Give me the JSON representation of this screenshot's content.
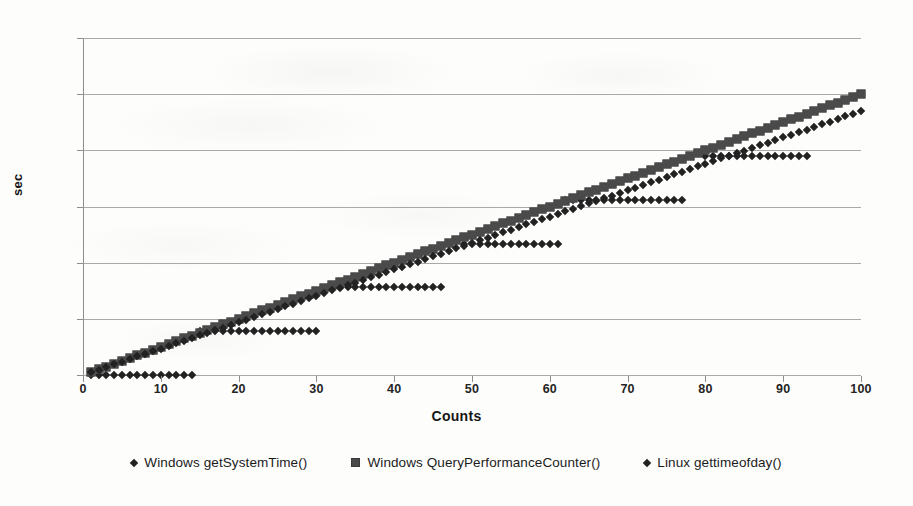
{
  "chart_data": {
    "type": "scatter",
    "title": "",
    "xlabel": "Counts",
    "ylabel": "sec",
    "xlim": [
      0,
      100
    ],
    "ylim": [
      0,
      0.12
    ],
    "xticks": [
      0,
      10,
      20,
      30,
      40,
      50,
      60,
      70,
      80,
      90,
      100
    ],
    "yticks": [
      0,
      0.02,
      0.04,
      0.06,
      0.08,
      0.1,
      0.12
    ],
    "ytick_labels": [
      "0",
      "0.02",
      "0.04",
      "0.06",
      "0.08",
      "0.1",
      "0.12"
    ],
    "xtick_labels": [
      "0",
      "10",
      "20",
      "30",
      "40",
      "50",
      "60",
      "70",
      "80",
      "90",
      "100"
    ],
    "grid": "horizontal",
    "legend_position": "bottom",
    "series": [
      {
        "name": "Windows getSystemTime()",
        "marker": "diamond",
        "color": "#222222",
        "x": [
          1,
          2,
          3,
          4,
          5,
          6,
          7,
          8,
          9,
          10,
          11,
          12,
          13,
          14,
          15,
          16,
          17,
          18,
          19,
          20,
          21,
          22,
          23,
          24,
          25,
          26,
          27,
          28,
          29,
          30,
          33,
          34,
          35,
          36,
          37,
          38,
          39,
          40,
          41,
          42,
          43,
          44,
          45,
          46,
          49,
          50,
          51,
          52,
          53,
          54,
          55,
          56,
          57,
          58,
          59,
          60,
          61,
          62,
          63,
          64,
          65,
          66,
          67,
          68,
          69,
          70,
          71,
          72,
          73,
          74,
          75,
          76,
          77,
          80,
          81,
          82,
          83,
          84,
          85,
          86,
          87,
          88,
          89,
          90,
          91,
          92,
          93
        ],
        "y": [
          0,
          0,
          0,
          0,
          0,
          0,
          0,
          0,
          0,
          0,
          0,
          0,
          0,
          0,
          0.0156,
          0.0156,
          0.0156,
          0.0156,
          0.0156,
          0.0156,
          0.0156,
          0.0156,
          0.0156,
          0.0156,
          0.0156,
          0.0156,
          0.0156,
          0.0156,
          0.0156,
          0.0156,
          0.0312,
          0.0312,
          0.0312,
          0.0312,
          0.0312,
          0.0312,
          0.0312,
          0.0312,
          0.0312,
          0.0312,
          0.0312,
          0.0312,
          0.0312,
          0.0312,
          0.0468,
          0.0468,
          0.0468,
          0.0468,
          0.0468,
          0.0468,
          0.0468,
          0.0468,
          0.0468,
          0.0468,
          0.0468,
          0.0468,
          0.0468,
          0.0624,
          0.0624,
          0.0624,
          0.0624,
          0.0624,
          0.0624,
          0.0624,
          0.0624,
          0.0624,
          0.0624,
          0.0624,
          0.0624,
          0.0624,
          0.0624,
          0.0624,
          0.0624,
          0.078,
          0.078,
          0.078,
          0.078,
          0.078,
          0.078,
          0.078,
          0.078,
          0.078,
          0.078,
          0.078,
          0.078,
          0.078,
          0.078
        ]
      },
      {
        "name": "Windows QueryPerformanceCounter()",
        "marker": "square",
        "color": "#4a4a4a",
        "x": [
          1,
          2,
          3,
          4,
          5,
          6,
          7,
          8,
          9,
          10,
          11,
          12,
          13,
          14,
          15,
          16,
          17,
          18,
          19,
          20,
          21,
          22,
          23,
          24,
          25,
          26,
          27,
          28,
          29,
          30,
          31,
          32,
          33,
          34,
          35,
          36,
          37,
          38,
          39,
          40,
          41,
          42,
          43,
          44,
          45,
          46,
          47,
          48,
          49,
          50,
          51,
          52,
          53,
          54,
          55,
          56,
          57,
          58,
          59,
          60,
          61,
          62,
          63,
          64,
          65,
          66,
          67,
          68,
          69,
          70,
          71,
          72,
          73,
          74,
          75,
          76,
          77,
          78,
          79,
          80,
          81,
          82,
          83,
          84,
          85,
          86,
          87,
          88,
          89,
          90,
          91,
          92,
          93,
          94,
          95,
          96,
          97,
          98,
          99,
          100
        ],
        "y": [
          0.001,
          0.002,
          0.003,
          0.004,
          0.005,
          0.006,
          0.007,
          0.008,
          0.009,
          0.01,
          0.011,
          0.012,
          0.013,
          0.014,
          0.015,
          0.016,
          0.017,
          0.018,
          0.019,
          0.02,
          0.021,
          0.022,
          0.023,
          0.024,
          0.025,
          0.026,
          0.027,
          0.028,
          0.029,
          0.03,
          0.031,
          0.032,
          0.033,
          0.034,
          0.035,
          0.036,
          0.037,
          0.038,
          0.039,
          0.04,
          0.041,
          0.042,
          0.043,
          0.044,
          0.045,
          0.046,
          0.047,
          0.048,
          0.049,
          0.05,
          0.051,
          0.052,
          0.053,
          0.054,
          0.055,
          0.056,
          0.057,
          0.058,
          0.059,
          0.06,
          0.061,
          0.062,
          0.063,
          0.064,
          0.065,
          0.066,
          0.067,
          0.068,
          0.069,
          0.07,
          0.071,
          0.072,
          0.073,
          0.074,
          0.075,
          0.076,
          0.077,
          0.078,
          0.079,
          0.08,
          0.081,
          0.082,
          0.083,
          0.084,
          0.085,
          0.086,
          0.087,
          0.088,
          0.089,
          0.09,
          0.091,
          0.092,
          0.093,
          0.094,
          0.095,
          0.096,
          0.097,
          0.098,
          0.099,
          0.1
        ]
      },
      {
        "name": "Linux gettimeofday()",
        "marker": "diamond",
        "color": "#222222",
        "x": [
          1,
          2,
          3,
          4,
          5,
          6,
          7,
          8,
          9,
          10,
          11,
          12,
          13,
          14,
          15,
          16,
          17,
          18,
          19,
          20,
          21,
          22,
          23,
          24,
          25,
          26,
          27,
          28,
          29,
          30,
          31,
          32,
          33,
          34,
          35,
          36,
          37,
          38,
          39,
          40,
          41,
          42,
          43,
          44,
          45,
          46,
          47,
          48,
          49,
          50,
          51,
          52,
          53,
          54,
          55,
          56,
          57,
          58,
          59,
          60,
          61,
          62,
          63,
          64,
          65,
          66,
          67,
          68,
          69,
          70,
          71,
          72,
          73,
          74,
          75,
          76,
          77,
          78,
          79,
          80,
          81,
          82,
          83,
          84,
          85,
          86,
          87,
          88,
          89,
          90,
          91,
          92,
          93,
          94,
          95,
          96,
          97,
          98,
          99,
          100
        ],
        "y": [
          0.0009,
          0.0019,
          0.0028,
          0.0038,
          0.0047,
          0.0056,
          0.0066,
          0.0075,
          0.0085,
          0.0094,
          0.0103,
          0.0113,
          0.0122,
          0.0132,
          0.0141,
          0.015,
          0.016,
          0.0169,
          0.0179,
          0.0188,
          0.0197,
          0.0207,
          0.0216,
          0.0226,
          0.0235,
          0.0244,
          0.0254,
          0.0263,
          0.0273,
          0.0282,
          0.0291,
          0.0301,
          0.031,
          0.032,
          0.0329,
          0.0338,
          0.0348,
          0.0357,
          0.0367,
          0.0376,
          0.0385,
          0.0395,
          0.0404,
          0.0414,
          0.0423,
          0.0432,
          0.0442,
          0.0451,
          0.0461,
          0.047,
          0.0479,
          0.0489,
          0.0498,
          0.0508,
          0.0517,
          0.0526,
          0.0536,
          0.0545,
          0.0555,
          0.0564,
          0.0573,
          0.0583,
          0.0592,
          0.0602,
          0.0611,
          0.062,
          0.063,
          0.0639,
          0.0649,
          0.0658,
          0.0667,
          0.0677,
          0.0686,
          0.0696,
          0.0705,
          0.0714,
          0.0724,
          0.0733,
          0.0743,
          0.0752,
          0.0761,
          0.0771,
          0.078,
          0.079,
          0.0799,
          0.0808,
          0.0818,
          0.0827,
          0.0837,
          0.0846,
          0.0855,
          0.0865,
          0.0874,
          0.0884,
          0.0893,
          0.0902,
          0.0912,
          0.0921,
          0.0931,
          0.094
        ]
      }
    ]
  },
  "legend": {
    "items": [
      {
        "label": "Windows getSystemTime()",
        "marker": "diamond"
      },
      {
        "label": "Windows QueryPerformanceCounter()",
        "marker": "square"
      },
      {
        "label": "Linux gettimeofday()",
        "marker": "diamond"
      }
    ]
  },
  "axes": {
    "x_title": "Counts",
    "y_title": "sec"
  }
}
